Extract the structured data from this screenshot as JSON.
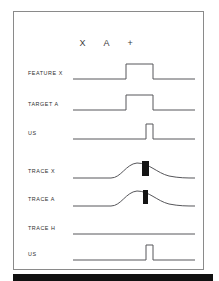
{
  "figure": {
    "header_glyphs": "X  A  +",
    "frame_color": "#8a8a8a",
    "trace_color": "#56565a",
    "marker_color": "#141414",
    "background": "#ffffff",
    "bottom_strip_color": "#111111"
  },
  "rows": [
    {
      "id": "feature-x",
      "label": "FEATURE  X",
      "signal_type": "square-pulse",
      "baseline": "low",
      "pulse_start_pct": 44,
      "pulse_end_pct": 66,
      "amplitude_pct": 55,
      "marker": "none",
      "top_px": 57
    },
    {
      "id": "target-a",
      "label": "TARGET  A",
      "signal_type": "square-pulse",
      "baseline": "low",
      "pulse_start_pct": 44,
      "pulse_end_pct": 66,
      "amplitude_pct": 55,
      "marker": "none",
      "top_px": 88
    },
    {
      "id": "us-top",
      "label": "US",
      "signal_type": "square-pulse",
      "baseline": "low",
      "pulse_start_pct": 60,
      "pulse_end_pct": 66,
      "amplitude_pct": 55,
      "marker": "none",
      "top_px": 117
    },
    {
      "id": "trace-x",
      "label": "TRACE  X",
      "signal_type": "bump-curve",
      "baseline": "low",
      "peak_pct": 60,
      "amplitude_pct": 45,
      "marker": "black-bar",
      "marker_width_px": 7,
      "marker_height_px": 15,
      "top_px": 155
    },
    {
      "id": "trace-a",
      "label": "TRACE  A",
      "signal_type": "bump-curve",
      "baseline": "low",
      "peak_pct": 60,
      "amplitude_pct": 45,
      "marker": "black-bar",
      "marker_width_px": 5,
      "marker_height_px": 14,
      "top_px": 183
    },
    {
      "id": "trace-h",
      "label": "TRACE  H",
      "signal_type": "flat-line",
      "baseline": "low",
      "marker": "none",
      "top_px": 212
    },
    {
      "id": "us-bottom",
      "label": "US",
      "signal_type": "square-pulse",
      "baseline": "low",
      "pulse_start_pct": 60,
      "pulse_end_pct": 66,
      "amplitude_pct": 55,
      "marker": "none",
      "top_px": 238
    }
  ]
}
